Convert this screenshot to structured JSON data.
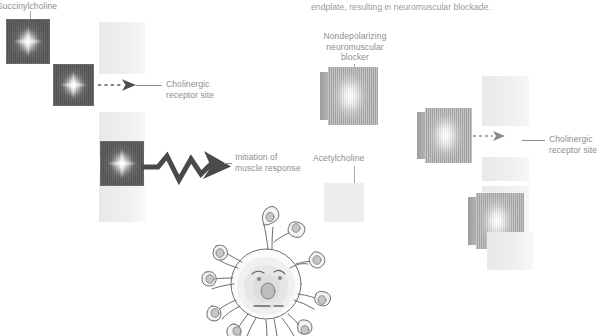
{
  "figure": {
    "domain_type": "diagram",
    "top_caption": "endplate, resulting in neuromuscular blockade.",
    "panels": [
      {
        "id": "depolarizing",
        "side": "left",
        "drug_label": "Succinylcholine",
        "receptor_label": "Cholinergic\nreceptor site",
        "outcome_label": "Initiation of\nmuscle response",
        "molecule_style": "dark-square-with-white-diamond-glow",
        "molecule_count": 3,
        "arrow_types": [
          "dashed-right",
          "bold-zigzag-right"
        ]
      },
      {
        "id": "nondepolarizing",
        "side": "right",
        "drug_label": "Nondepolarizing\nneuromuscular\nblocker",
        "transmitter_label": "Acetylcholine",
        "receptor_label": "Cholinergic\nreceptor site",
        "molecule_style": "light-notched-key-shape",
        "molecule_count": 3,
        "arrow_types": [
          "dashed-right"
        ]
      }
    ],
    "cell_illustration": {
      "name": "muscle-cell-with-nerve-terminals",
      "description": "line-art round cell body with face-like nucleus and radiating branched axon terminals ending in bulbs"
    },
    "colors": {
      "text": "#8d8d8d",
      "caption": "#9a9a9a",
      "molecule_dark": "#575757",
      "molecule_light": "#aeaeae",
      "receptor_plate": "#ededed",
      "arrow": "#4f4f4f",
      "leader_line": "#8d8d8d",
      "background": "#ffffff"
    }
  }
}
